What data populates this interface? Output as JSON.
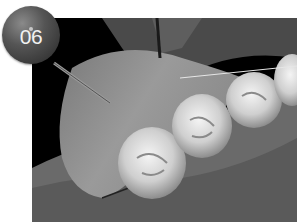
{
  "badge": {
    "label": "06"
  },
  "illustration": {
    "subject": "dental-arch-teeth-with-instrument",
    "style": "grayscale-3d-render"
  },
  "colors": {
    "background": "#ffffff",
    "frame": "#000000",
    "badge": "#4a4a4a",
    "badge_text": "#f2f2f2"
  }
}
